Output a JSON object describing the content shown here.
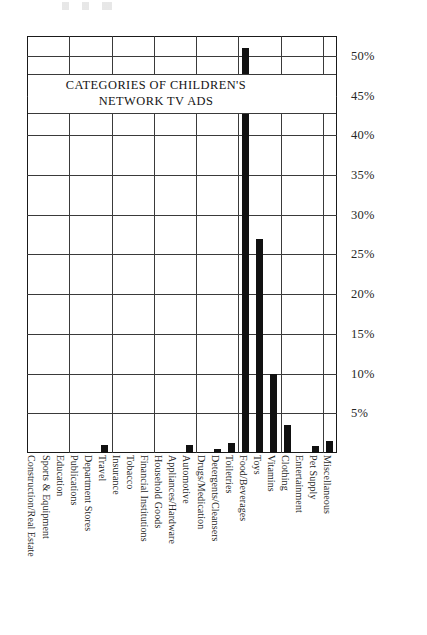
{
  "chart_data": {
    "type": "bar",
    "title": "CATEGORIES OF CHILDREN'S\nNETWORK  TV ADS",
    "xlabel": "",
    "ylabel": "",
    "ylim": [
      0,
      52.5
    ],
    "grid": true,
    "legend": "none",
    "orientation": "vertical",
    "bar_color": "#111111",
    "categories": [
      "Construction/Real Estate",
      "Sports & Equipment",
      "Education",
      "Publications",
      "Department Stores",
      "Travel",
      "Insurance",
      "Tobacco",
      "Financial Institutions",
      "Household Goods",
      "Appliances/Hardware",
      "Automotive",
      "Drugs/Medication",
      "Detergents/Cleansers",
      "Toiletries",
      "Food/Beverages",
      "Toys",
      "Vitamins",
      "Clothing",
      "Entertainment",
      "Pet Supply",
      "Miscellaneous"
    ],
    "values": [
      0,
      0,
      0,
      0,
      0,
      1.0,
      0,
      0,
      0,
      0,
      0,
      1.0,
      0,
      0.5,
      1.2,
      51.0,
      27.0,
      10.0,
      3.5,
      0,
      0.9,
      1.5
    ],
    "ytick_labels": [
      "5%",
      "10%",
      "15%",
      "20%",
      "25%",
      "30%",
      "35%",
      "40%",
      "45%",
      "50%"
    ],
    "ytick_values": [
      5,
      10,
      15,
      20,
      25,
      30,
      35,
      40,
      45,
      50
    ]
  }
}
